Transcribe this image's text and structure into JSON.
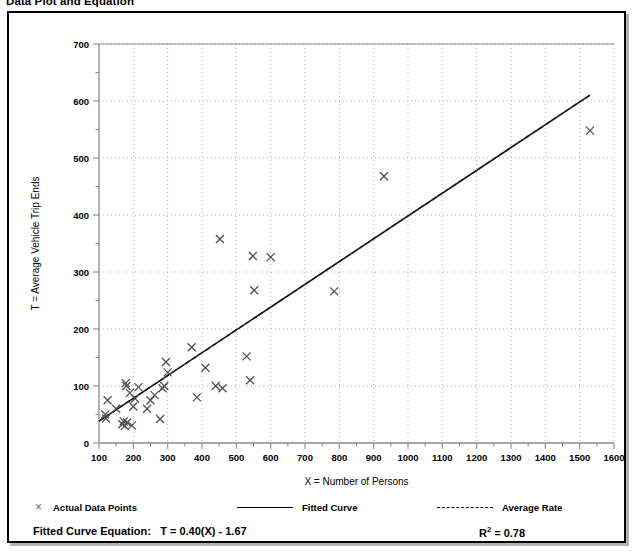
{
  "figure": {
    "title": "Data Plot and Equation"
  },
  "chart_data": {
    "type": "scatter",
    "title": "Data Plot and Equation",
    "xlabel": "X = Number of Persons",
    "ylabel": "T = Average Vehicle Trip Ends",
    "xlim": [
      100,
      1600
    ],
    "ylim": [
      0,
      700
    ],
    "x_ticks": [
      100,
      200,
      300,
      400,
      500,
      600,
      700,
      800,
      900,
      1000,
      1100,
      1200,
      1300,
      1400,
      1500,
      1600
    ],
    "y_ticks": [
      0,
      100,
      200,
      300,
      400,
      500,
      600,
      700
    ],
    "x_minor_step": 50,
    "y_minor_step": 50,
    "grid": true,
    "grid_style": "dotted",
    "legend_position": "below-plot",
    "series": [
      {
        "name": "Actual Data Points",
        "type": "scatter",
        "marker": "x",
        "color": "#4d4d4d",
        "points": [
          [
            118,
            50
          ],
          [
            120,
            43
          ],
          [
            125,
            75
          ],
          [
            150,
            60
          ],
          [
            168,
            33
          ],
          [
            172,
            38
          ],
          [
            175,
            30
          ],
          [
            178,
            105
          ],
          [
            180,
            100
          ],
          [
            182,
            36
          ],
          [
            190,
            88
          ],
          [
            196,
            31
          ],
          [
            200,
            64
          ],
          [
            205,
            78
          ],
          [
            215,
            98
          ],
          [
            240,
            60
          ],
          [
            250,
            75
          ],
          [
            262,
            84
          ],
          [
            278,
            42
          ],
          [
            285,
            96
          ],
          [
            290,
            100
          ],
          [
            295,
            142
          ],
          [
            300,
            124
          ],
          [
            370,
            168
          ],
          [
            385,
            80
          ],
          [
            410,
            132
          ],
          [
            440,
            100
          ],
          [
            452,
            358
          ],
          [
            460,
            96
          ],
          [
            530,
            152
          ],
          [
            540,
            110
          ],
          [
            548,
            328
          ],
          [
            552,
            268
          ],
          [
            600,
            326
          ],
          [
            785,
            266
          ],
          [
            930,
            468
          ],
          [
            1530,
            548
          ]
        ]
      },
      {
        "name": "Fitted Curve",
        "type": "line",
        "style": "solid",
        "color": "#000000",
        "equation": "T = 0.40(X) - 1.67",
        "slope": 0.4,
        "intercept": -1.67,
        "x_range": [
          100,
          1530
        ]
      },
      {
        "name": "Average Rate",
        "type": "line",
        "style": "dashed",
        "color": "#000000",
        "slope": 0.4,
        "intercept": -1.67,
        "x_range": [
          100,
          1530
        ]
      }
    ],
    "annotations": {
      "equation_label": "Fitted Curve Equation:",
      "equation_value": "T = 0.40(X) - 1.67",
      "r_squared_symbol": "R",
      "r_squared_exponent": "2",
      "r_squared_value": "= 0.78",
      "r_squared": 0.78
    }
  },
  "legend": {
    "items": [
      {
        "label": "Actual Data Points",
        "marker": "x-marker"
      },
      {
        "label": "Fitted Curve",
        "marker": "solid-line"
      },
      {
        "label": "Average Rate",
        "marker": "dashed-line"
      }
    ]
  },
  "colors": {
    "frame": "#000000",
    "background": "#ffffff",
    "axis": "#8a8a8a",
    "grid": "#9a9a9a",
    "marker": "#4d4d4d",
    "line": "#1a1a1a"
  }
}
